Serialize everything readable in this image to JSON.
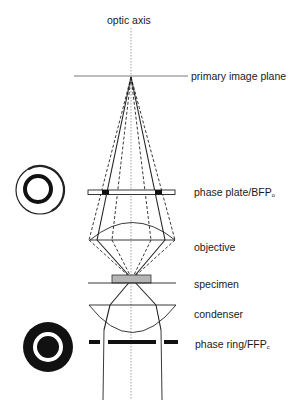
{
  "diagram": {
    "type": "phase contrast microscope optical path",
    "labels": {
      "optic_axis": "optic axis",
      "primary_image_plane": "primary image plane",
      "phase_plate": "phase plate/BFP",
      "phase_plate_sub": "o",
      "objective": "objective",
      "specimen": "specimen",
      "condenser": "condenser",
      "phase_ring": "phase ring/FFP",
      "phase_ring_sub": "c"
    },
    "icons": {
      "phase_plate_icon": "phase-plate-ring-icon",
      "phase_ring_icon": "annular-phase-ring-icon"
    },
    "colors": {
      "line": "#222222",
      "specimen_fill": "#b5b5b5",
      "axis": "#777777"
    }
  }
}
